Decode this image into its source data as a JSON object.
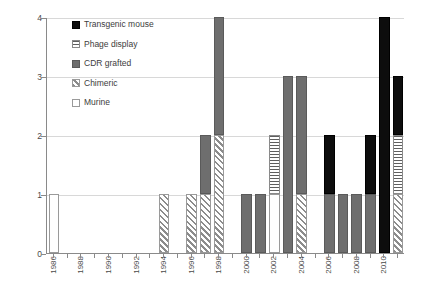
{
  "chart_data": {
    "type": "bar",
    "subtype": "stacked-bar",
    "title": "",
    "xlabel": "",
    "ylabel": "",
    "ylim": [
      0,
      4
    ],
    "yticks": [
      "0",
      "1",
      "2",
      "3",
      "4"
    ],
    "grid": true,
    "legend_position": "top-left-inside",
    "categories": [
      "1986",
      "1987",
      "1988",
      "1989",
      "1990",
      "1991",
      "1992",
      "1993",
      "1994",
      "1995",
      "1996",
      "1997",
      "1998",
      "1999",
      "2000",
      "2001",
      "2002",
      "2003",
      "2004",
      "2005",
      "2006",
      "2007",
      "2008",
      "2009",
      "2010",
      "2011"
    ],
    "tick_labels": [
      "1986",
      "1988",
      "1990",
      "1992",
      "1994",
      "1996",
      "1998",
      "2000",
      "2002",
      "2004",
      "2006",
      "2008",
      "2010"
    ],
    "series": [
      {
        "name": "Transgenic mouse",
        "color": "#0d0d0d",
        "fill": "solid-black",
        "values": [
          0,
          0,
          0,
          0,
          0,
          0,
          0,
          0,
          0,
          0,
          0,
          0,
          0,
          0,
          0,
          0,
          0,
          0,
          0,
          0,
          1,
          0,
          0,
          1,
          4,
          1
        ]
      },
      {
        "name": "Phage display",
        "color": "#5f5f5f",
        "fill": "horizontal-stripes",
        "values": [
          0,
          0,
          0,
          0,
          0,
          0,
          0,
          0,
          0,
          0,
          0,
          0,
          0,
          0,
          0,
          0,
          1,
          0,
          0,
          0,
          0,
          0,
          0,
          0,
          0,
          1
        ]
      },
      {
        "name": "CDR grafted",
        "color": "#6e6e6e",
        "fill": "solid-gray",
        "values": [
          0,
          0,
          0,
          0,
          0,
          0,
          0,
          0,
          0,
          0,
          0,
          1,
          2,
          0,
          1,
          1,
          0,
          3,
          2,
          0,
          1,
          1,
          1,
          1,
          0,
          0
        ]
      },
      {
        "name": "Chimeric",
        "color": "#8c8c8c",
        "fill": "diagonal-hatch",
        "values": [
          0,
          0,
          0,
          0,
          0,
          0,
          0,
          0,
          1,
          0,
          1,
          1,
          2,
          0,
          0,
          0,
          0,
          0,
          1,
          0,
          0,
          0,
          0,
          0,
          0,
          1
        ]
      },
      {
        "name": "Murine",
        "color": "#ffffff",
        "fill": "white-outline",
        "values": [
          1,
          0,
          0,
          0,
          0,
          0,
          0,
          0,
          0,
          0,
          0,
          0,
          0,
          0,
          0,
          0,
          1,
          0,
          0,
          0,
          0,
          0,
          0,
          0,
          0,
          0
        ]
      }
    ],
    "totals": [
      1,
      0,
      0,
      0,
      0,
      0,
      0,
      0,
      1,
      0,
      1,
      2,
      4,
      0,
      1,
      1,
      2,
      3,
      3,
      0,
      2,
      1,
      1,
      2,
      4,
      3
    ]
  },
  "legend": {
    "items": [
      {
        "label": "Transgenic mouse",
        "swatch": "solid-black"
      },
      {
        "label": "Phage display",
        "swatch": "horizontal-stripes"
      },
      {
        "label": "CDR grafted",
        "swatch": "solid-gray"
      },
      {
        "label": "Chimeric",
        "swatch": "diagonal-hatch"
      },
      {
        "label": "Murine",
        "swatch": "white-outline"
      }
    ]
  },
  "axes": {
    "y_tick_labels": [
      "0",
      "1",
      "2",
      "3",
      "4"
    ],
    "x_tick_labels": [
      "1986",
      "1988",
      "1990",
      "1992",
      "1994",
      "1996",
      "1998",
      "2000",
      "2002",
      "2004",
      "2006",
      "2008",
      "2010"
    ]
  }
}
